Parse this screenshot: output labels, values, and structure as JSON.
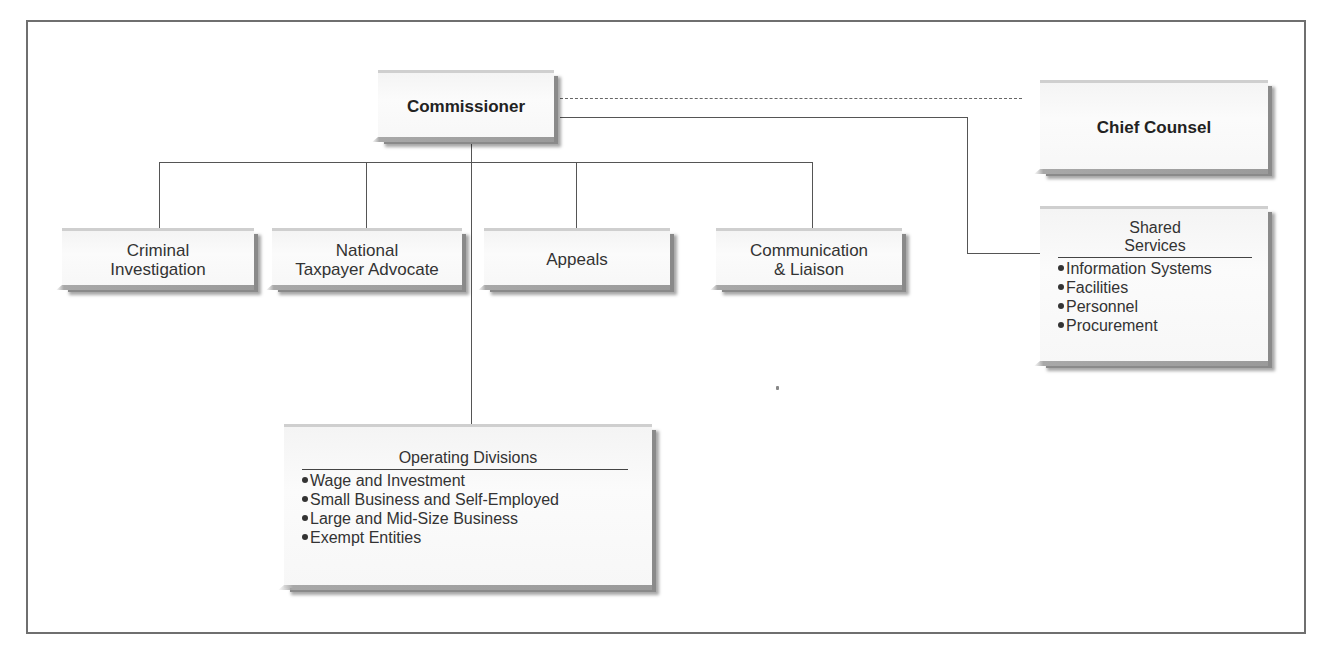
{
  "chart": {
    "type": "org-chart",
    "head": {
      "label": "Commissioner"
    },
    "dotted_report": {
      "label": "Chief Counsel"
    },
    "staff_offices": [
      {
        "label_line1": "Criminal",
        "label_line2": "Investigation"
      },
      {
        "label_line1": "National",
        "label_line2": "Taxpayer Advocate"
      },
      {
        "label_line1": "Appeals",
        "label_line2": ""
      },
      {
        "label_line1": "Communication",
        "label_line2": "& Liaison"
      }
    ],
    "shared_services": {
      "title_line1": "Shared",
      "title_line2": "Services",
      "items": [
        "Information Systems",
        "Facilities",
        "Personnel",
        "Procurement"
      ]
    },
    "operating_divisions": {
      "title": "Operating Divisions",
      "items": [
        "Wage and Investment",
        "Small Business and Self-Employed",
        "Large and Mid-Size Business",
        "Exempt Entities"
      ]
    }
  },
  "colors": {
    "frame": "#6f6f6f",
    "connector": "#555555",
    "box_fill": "#f6f6f6",
    "box_shadow": "#8a8a8a",
    "text": "#2a2a2a"
  }
}
